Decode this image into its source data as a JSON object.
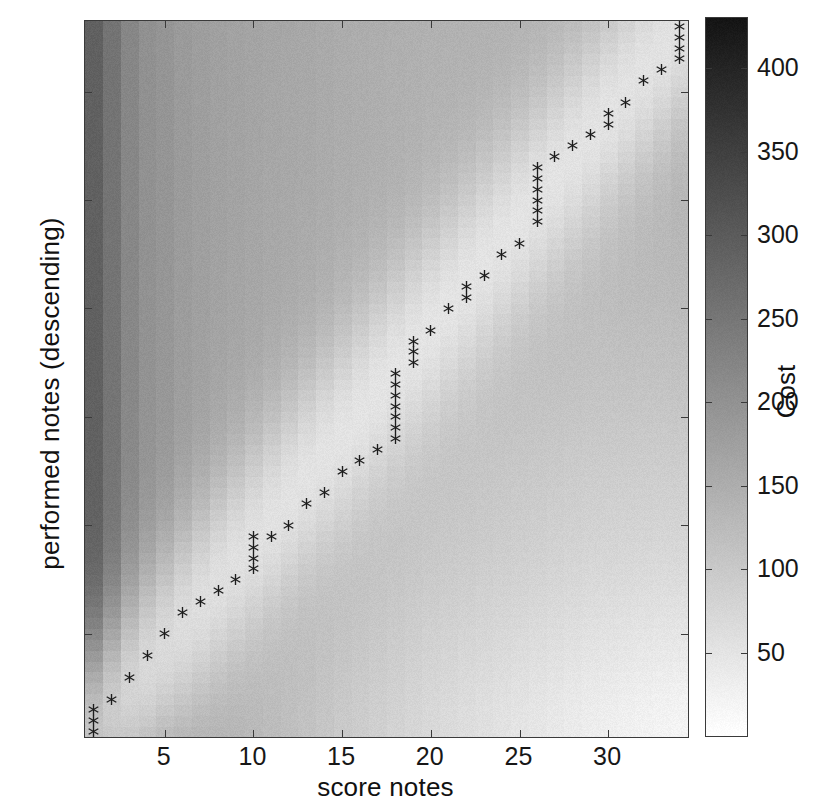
{
  "chart_data": {
    "type": "heatmap",
    "title": "",
    "xlabel": "score notes",
    "ylabel": "performed notes (descending)",
    "xlim": [
      0.5,
      34.5
    ],
    "ylim": [
      0.5,
      66.5
    ],
    "xticks": [
      5,
      10,
      15,
      20,
      25,
      30
    ],
    "yticks": [
      10,
      20,
      30,
      40,
      50,
      60
    ],
    "grid": false,
    "legend_position": "none",
    "colorbar": {
      "label": "Cost",
      "ticks": [
        50,
        100,
        150,
        200,
        250,
        300,
        350,
        400
      ],
      "range": [
        0,
        430
      ],
      "colormap": "gray-reversed",
      "low_color": "#ffffff",
      "high_color": "#1a1a1a"
    },
    "n_score_notes": 34,
    "n_performed_notes": 66,
    "marker_symbol": "asterisk",
    "marker_color": "#1d1d1d",
    "marker_series_name": "optimal alignment path",
    "path": [
      [
        1,
        1
      ],
      [
        1,
        2
      ],
      [
        1,
        3
      ],
      [
        2,
        4
      ],
      [
        3,
        6
      ],
      [
        4,
        8
      ],
      [
        5,
        10
      ],
      [
        6,
        12
      ],
      [
        7,
        13
      ],
      [
        8,
        14
      ],
      [
        9,
        15
      ],
      [
        10,
        16
      ],
      [
        10,
        17
      ],
      [
        10,
        18
      ],
      [
        10,
        19
      ],
      [
        11,
        19
      ],
      [
        12,
        20
      ],
      [
        13,
        22
      ],
      [
        14,
        23
      ],
      [
        15,
        25
      ],
      [
        16,
        26
      ],
      [
        17,
        27
      ],
      [
        18,
        28
      ],
      [
        18,
        29
      ],
      [
        18,
        30
      ],
      [
        18,
        31
      ],
      [
        18,
        32
      ],
      [
        18,
        33
      ],
      [
        18,
        34
      ],
      [
        19,
        35
      ],
      [
        19,
        36
      ],
      [
        19,
        37
      ],
      [
        20,
        38
      ],
      [
        21,
        40
      ],
      [
        22,
        41
      ],
      [
        22,
        42
      ],
      [
        23,
        43
      ],
      [
        24,
        45
      ],
      [
        25,
        46
      ],
      [
        26,
        48
      ],
      [
        26,
        49
      ],
      [
        26,
        50
      ],
      [
        26,
        51
      ],
      [
        26,
        52
      ],
      [
        26,
        53
      ],
      [
        27,
        54
      ],
      [
        28,
        55
      ],
      [
        29,
        56
      ],
      [
        30,
        57
      ],
      [
        30,
        58
      ],
      [
        31,
        59
      ],
      [
        32,
        61
      ],
      [
        33,
        62
      ],
      [
        34,
        63
      ],
      [
        34,
        64
      ],
      [
        34,
        65
      ],
      [
        34,
        66
      ]
    ],
    "cost_column_profile": [
      410,
      355,
      300,
      268,
      252,
      232,
      218,
      206,
      196,
      186,
      176,
      168,
      160,
      150,
      140,
      132,
      124,
      116,
      108,
      100,
      94,
      88,
      82,
      76,
      70,
      64,
      58,
      52,
      46,
      42,
      38,
      34,
      30,
      28
    ],
    "cost_row_profile": [
      2,
      6,
      12,
      20,
      30,
      42,
      54,
      66,
      78,
      90,
      104,
      116,
      128,
      140,
      152,
      162,
      172,
      182,
      192,
      200,
      208,
      216,
      224,
      232,
      240,
      248,
      256,
      264,
      272,
      280,
      288,
      296,
      304,
      312,
      318,
      324,
      330,
      336,
      342,
      348,
      354,
      358,
      362,
      366,
      370,
      374,
      378,
      382,
      386,
      390,
      394,
      396,
      398,
      400,
      402,
      404,
      406,
      407,
      408,
      409,
      410,
      411,
      412,
      413,
      414,
      415
    ],
    "valley_depth": 0.62,
    "valley_width": 3.4,
    "noise_amplitude": 9
  },
  "axis": {
    "x_label": "score notes",
    "y_label": "performed notes (descending)",
    "x_tick_labels": [
      "5",
      "10",
      "15",
      "20",
      "25",
      "30"
    ],
    "y_tick_labels": [
      "10",
      "20",
      "30",
      "40",
      "50",
      "60"
    ]
  },
  "colorbar": {
    "title": "Cost",
    "tick_labels": [
      "50",
      "100",
      "150",
      "200",
      "250",
      "300",
      "350",
      "400"
    ]
  }
}
